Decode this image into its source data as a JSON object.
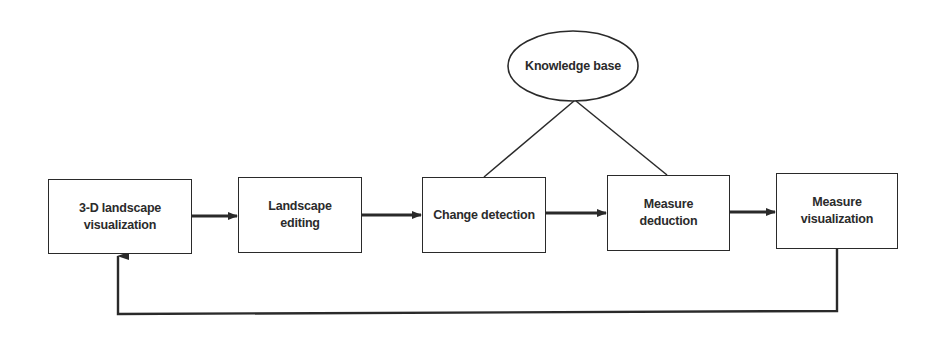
{
  "diagram": {
    "type": "flowchart",
    "colors": {
      "stroke": "#2a2a2a",
      "text": "#2b2b2b",
      "background": "#ffffff"
    },
    "knowledge_base": {
      "label": "Knowledge base",
      "shape": "ellipse"
    },
    "nodes": [
      {
        "id": "n1",
        "label": "3-D landscape\nvisualization"
      },
      {
        "id": "n2",
        "label": "Landscape\nediting"
      },
      {
        "id": "n3",
        "label": "Change detection"
      },
      {
        "id": "n4",
        "label": "Measure\ndeduction"
      },
      {
        "id": "n5",
        "label": "Measure\nvisualization"
      }
    ],
    "edges": [
      {
        "from": "n1",
        "to": "n2",
        "type": "arrow"
      },
      {
        "from": "n2",
        "to": "n3",
        "type": "arrow"
      },
      {
        "from": "n3",
        "to": "n4",
        "type": "arrow"
      },
      {
        "from": "n4",
        "to": "n5",
        "type": "arrow"
      },
      {
        "from": "n5",
        "to": "n1",
        "type": "feedback-arrow"
      },
      {
        "from": "knowledge_base",
        "to": "n3",
        "type": "line"
      },
      {
        "from": "knowledge_base",
        "to": "n4",
        "type": "line"
      }
    ]
  }
}
